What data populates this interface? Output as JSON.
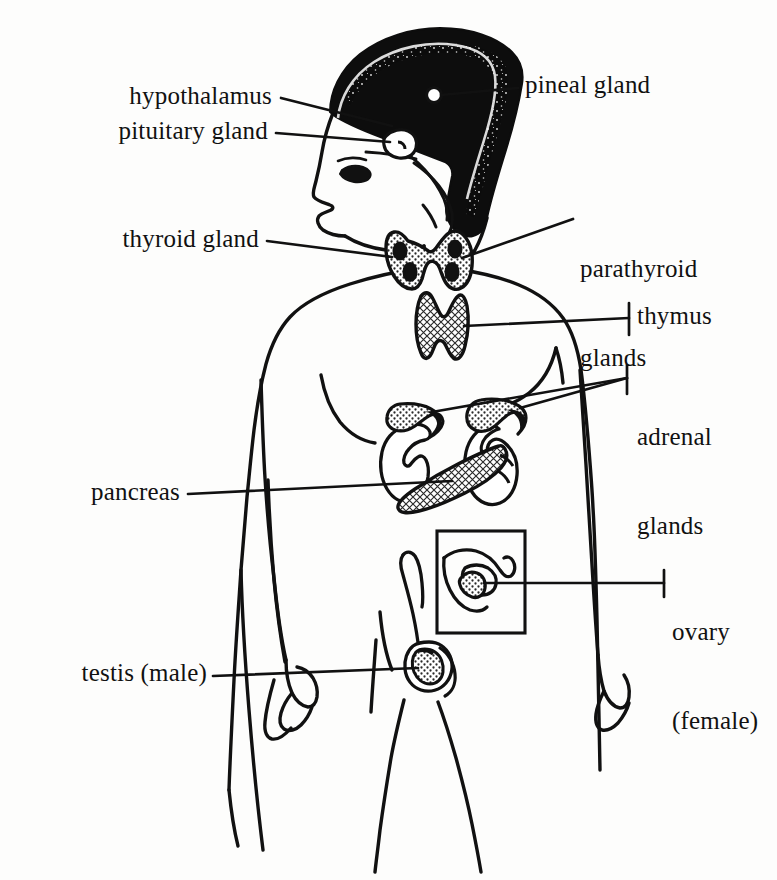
{
  "figure": {
    "type": "anatomical-diagram",
    "style": "black-and-white line drawing",
    "view": "human body, front view with head in left profile",
    "background_color": "#fdfdfc",
    "line_color": "#111111",
    "fill_pattern": "stippled / cross-hatched gray"
  },
  "labels": {
    "hypothalamus": "hypothalamus",
    "pituitary_gland": "pituitary gland",
    "pineal_gland": "pineal gland",
    "thyroid_gland": "thyroid gland",
    "parathyroid_glands_line1": "parathyroid",
    "parathyroid_glands_line2": "glands",
    "thymus": "thymus",
    "adrenal_glands_line1": "adrenal",
    "adrenal_glands_line2": "glands",
    "pancreas": "pancreas",
    "ovary_line1": "ovary",
    "ovary_line2": "(female)",
    "testis": "testis (male)"
  },
  "organs": [
    {
      "name": "hypothalamus",
      "label": "hypothalamus",
      "side": "left"
    },
    {
      "name": "pituitary-gland",
      "label": "pituitary gland",
      "side": "left"
    },
    {
      "name": "pineal-gland",
      "label": "pineal gland",
      "side": "right"
    },
    {
      "name": "thyroid-gland",
      "label": "thyroid gland",
      "side": "left"
    },
    {
      "name": "parathyroid-glands",
      "label": "parathyroid glands",
      "side": "right"
    },
    {
      "name": "thymus",
      "label": "thymus",
      "side": "right"
    },
    {
      "name": "adrenal-glands",
      "label": "adrenal glands",
      "side": "right"
    },
    {
      "name": "pancreas",
      "label": "pancreas",
      "side": "left"
    },
    {
      "name": "ovary",
      "label": "ovary (female)",
      "side": "right"
    },
    {
      "name": "testis",
      "label": "testis (male)",
      "side": "left"
    }
  ]
}
